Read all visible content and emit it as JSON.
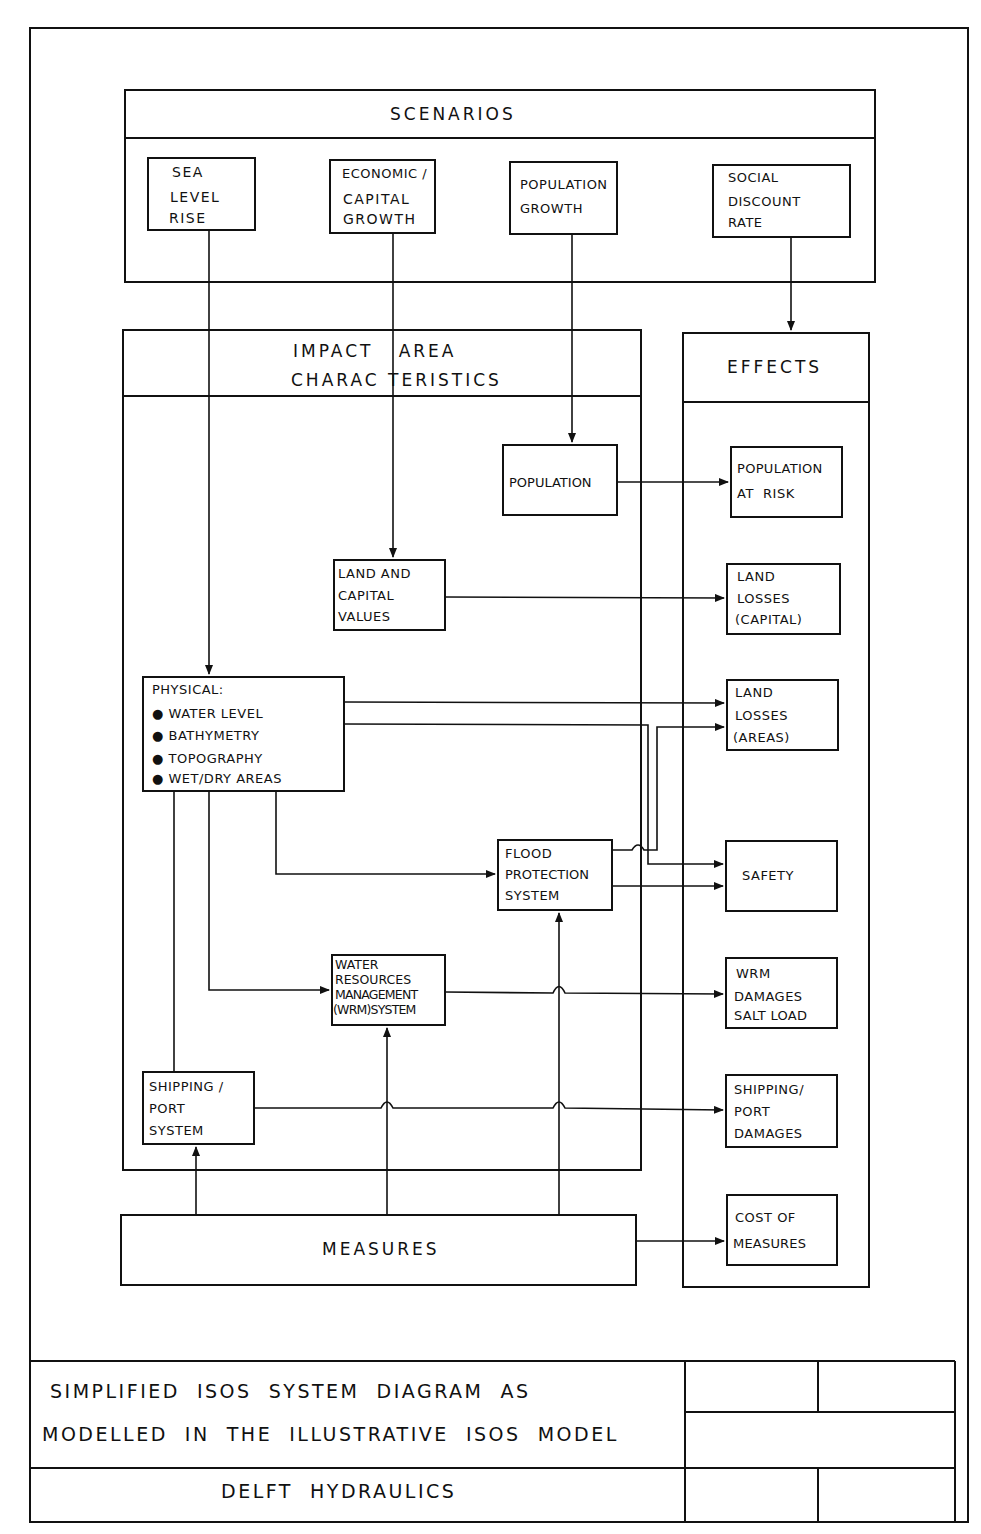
{
  "diagram": {
    "scenarios": {
      "title": "SCENARIOS",
      "items": [
        {
          "id": "sea-level-rise",
          "lines": [
            "SEA",
            "LEVEL",
            "RISE"
          ]
        },
        {
          "id": "economic-capital-growth",
          "lines": [
            "ECONOMIC /",
            "CAPITAL",
            "GROWTH"
          ]
        },
        {
          "id": "population-growth",
          "lines": [
            "POPULATION",
            "GROWTH"
          ]
        },
        {
          "id": "social-discount-rate",
          "lines": [
            "SOCIAL",
            "DISCOUNT",
            "RATE"
          ]
        }
      ]
    },
    "impact_area": {
      "title_lines": [
        "IMPACT   AREA",
        "CHARAC TERISTICS"
      ],
      "population": "POPULATION",
      "land_capital_values": [
        "LAND AND",
        "CAPITAL",
        "VALUES"
      ],
      "physical": {
        "heading": "PHYSICAL:",
        "bullets": [
          "WATER LEVEL",
          "BATHYMETRY",
          "TOPOGRAPHY",
          "WET/DRY AREAS"
        ]
      },
      "flood_protection": [
        "FLOOD",
        "PROTECTION",
        "SYSTEM"
      ],
      "wrm_system": [
        "WATER",
        "RESOURCES",
        "MANAGEMENT",
        "(WRM)SYSTEM"
      ],
      "shipping_port": [
        "SHIPPING /",
        "PORT",
        "SYSTEM"
      ]
    },
    "measures": "MEASURES",
    "effects": {
      "title": "EFFECTS",
      "items": [
        {
          "id": "population-at-risk",
          "lines": [
            "POPULATION",
            "AT  RISK"
          ]
        },
        {
          "id": "land-losses-capital",
          "lines": [
            "LAND",
            "LOSSES",
            "(CAPITAL)"
          ]
        },
        {
          "id": "land-losses-areas",
          "lines": [
            "LAND",
            "LOSSES",
            "(AREAS)"
          ]
        },
        {
          "id": "safety",
          "lines": [
            "SAFETY"
          ]
        },
        {
          "id": "wrm-damages",
          "lines": [
            "WRM",
            "DAMAGES",
            "SALT LOAD"
          ]
        },
        {
          "id": "shipping-port-damages",
          "lines": [
            "SHIPPING/",
            "PORT",
            "DAMAGES"
          ]
        },
        {
          "id": "cost-of-measures",
          "lines": [
            "COST OF",
            "MEASURES"
          ]
        }
      ]
    },
    "connections": [
      {
        "from": "sea-level-rise",
        "to": "physical"
      },
      {
        "from": "economic-capital-growth",
        "to": "land-capital-values"
      },
      {
        "from": "population-growth",
        "to": "population"
      },
      {
        "from": "social-discount-rate",
        "to": "effects"
      },
      {
        "from": "population",
        "to": "population-at-risk"
      },
      {
        "from": "land-capital-values",
        "to": "land-losses-capital"
      },
      {
        "from": "physical",
        "to": "land-losses-areas"
      },
      {
        "from": "physical",
        "to": "safety"
      },
      {
        "from": "physical",
        "to": "flood-protection"
      },
      {
        "from": "physical",
        "to": "wrm-system"
      },
      {
        "from": "physical",
        "to": "shipping-port"
      },
      {
        "from": "flood-protection",
        "to": "land-losses-areas"
      },
      {
        "from": "flood-protection",
        "to": "safety"
      },
      {
        "from": "wrm-system",
        "to": "wrm-damages"
      },
      {
        "from": "shipping-port",
        "to": "shipping-port-damages"
      },
      {
        "from": "measures",
        "to": "shipping-port"
      },
      {
        "from": "measures",
        "to": "wrm-system"
      },
      {
        "from": "measures",
        "to": "flood-protection"
      },
      {
        "from": "measures",
        "to": "cost-of-measures"
      }
    ]
  },
  "title_block": {
    "caption_lines": [
      "SIMPLIFIED  ISOS  SYSTEM  DIAGRAM  AS",
      "MODELLED  IN  THE  ILLUSTRATIVE  ISOS  MODEL"
    ],
    "organization": "DELFT  HYDRAULICS"
  }
}
